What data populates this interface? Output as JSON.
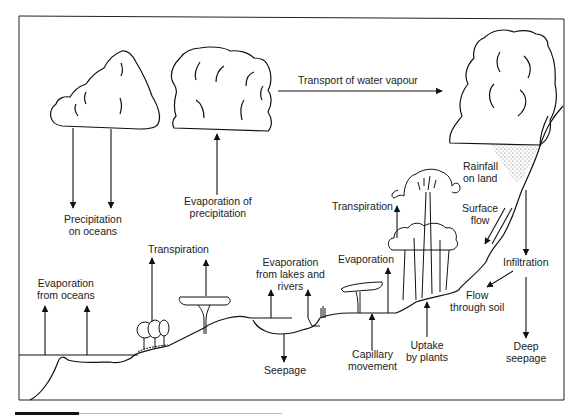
{
  "diagram": {
    "colors": {
      "stroke": "#111111",
      "text": "#222222",
      "background": "#ffffff",
      "rain": "#555555"
    },
    "labels": {
      "transport": "Transport of water vapour",
      "evap_precip": [
        "Evaporation of",
        "precipitation"
      ],
      "precip_oceans": [
        "Precipitation",
        "on oceans"
      ],
      "evap_oceans": [
        "Evaporation",
        "from oceans"
      ],
      "transpiration_left": "Transpiration",
      "evap_lakes": [
        "Evaporation",
        "from lakes and",
        "rivers"
      ],
      "seepage": "Seepage",
      "capillary": [
        "Capillary",
        "movement"
      ],
      "evaporation_mid": "Evaporation",
      "transpiration_right": "Transpiration",
      "uptake": [
        "Uptake",
        "by plants"
      ],
      "rainfall": [
        "Rainfall",
        "on land"
      ],
      "surface_flow": [
        "Surface",
        "flow"
      ],
      "infiltration": "Infiltration",
      "flow_soil": [
        "Flow",
        "through soil"
      ],
      "deep_seepage": [
        "Deep",
        "seepage"
      ]
    },
    "elements": {
      "clouds": [
        "ocean-cloud",
        "evaporation-cloud",
        "land-rain-cloud"
      ],
      "vegetation": [
        "shrubs",
        "acacia-tree-left",
        "acacia-tree-mid",
        "forest-trees"
      ],
      "water_bodies": [
        "ocean",
        "lake"
      ]
    }
  }
}
